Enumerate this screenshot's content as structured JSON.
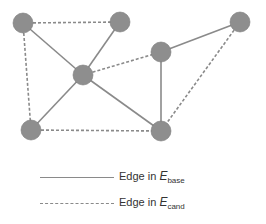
{
  "diagram": {
    "node_color": "#8e8e8e",
    "node_stroke": "#7a7a7a",
    "edge_color": "#8a8a8a",
    "node_radius": 10,
    "nodes": [
      {
        "id": "n1",
        "x": 23,
        "y": 23
      },
      {
        "id": "n2",
        "x": 120,
        "y": 22
      },
      {
        "id": "n3",
        "x": 240,
        "y": 22
      },
      {
        "id": "n4",
        "x": 83,
        "y": 75
      },
      {
        "id": "n5",
        "x": 161,
        "y": 52
      },
      {
        "id": "n6",
        "x": 31,
        "y": 130
      },
      {
        "id": "n7",
        "x": 161,
        "y": 131
      }
    ],
    "edges": [
      {
        "from": "n1",
        "to": "n2",
        "type": "cand"
      },
      {
        "from": "n1",
        "to": "n4",
        "type": "base"
      },
      {
        "from": "n1",
        "to": "n6",
        "type": "cand"
      },
      {
        "from": "n2",
        "to": "n4",
        "type": "base"
      },
      {
        "from": "n4",
        "to": "n5",
        "type": "cand"
      },
      {
        "from": "n4",
        "to": "n6",
        "type": "base"
      },
      {
        "from": "n4",
        "to": "n7",
        "type": "base"
      },
      {
        "from": "n5",
        "to": "n3",
        "type": "base"
      },
      {
        "from": "n5",
        "to": "n7",
        "type": "base"
      },
      {
        "from": "n3",
        "to": "n7",
        "type": "cand"
      },
      {
        "from": "n6",
        "to": "n7",
        "type": "cand"
      }
    ]
  },
  "legend": {
    "base": {
      "prefix": "Edge in ",
      "symbol": "E",
      "subscript": "base"
    },
    "cand": {
      "prefix": "Edge in ",
      "symbol": "E",
      "subscript": "cand"
    }
  }
}
